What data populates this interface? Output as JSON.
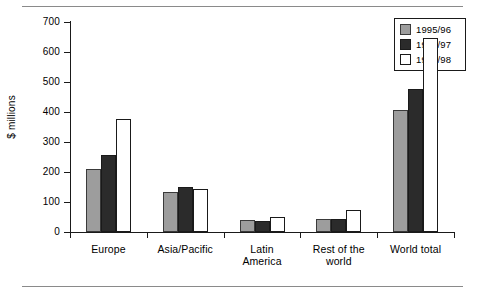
{
  "chart_data": {
    "type": "bar",
    "title": "",
    "xlabel": "",
    "ylabel": "$ millions",
    "ylim": [
      0,
      700
    ],
    "yticks": [
      0,
      100,
      200,
      300,
      400,
      500,
      600,
      700
    ],
    "ytick_labels": [
      "0",
      "100",
      "200",
      "300",
      "400",
      "500",
      "600",
      "700"
    ],
    "grid": false,
    "legend_position": "top-right",
    "categories": [
      "Europe",
      "Asia/Pacific",
      "Latin America",
      "Rest of the world",
      "World total"
    ],
    "category_label_lines": [
      [
        "Europe"
      ],
      [
        "Asia/Pacific"
      ],
      [
        "Latin",
        "America"
      ],
      [
        "Rest of the",
        "world"
      ],
      [
        "World total"
      ]
    ],
    "series": [
      {
        "name": "1995/96",
        "color": "#9d9d9d",
        "values": [
          210,
          135,
          40,
          45,
          408
        ]
      },
      {
        "name": "1996/97",
        "color": "#2b2b2b",
        "values": [
          258,
          150,
          37,
          43,
          478
        ]
      },
      {
        "name": "1997/98",
        "color": "#ffffff",
        "values": [
          378,
          145,
          50,
          75,
          648
        ]
      }
    ]
  }
}
